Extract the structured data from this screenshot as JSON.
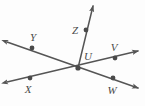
{
  "figure": {
    "background_color": "#fdfdfd",
    "stroke_color": "#555555",
    "label_color": "#4a4a4a",
    "width": 145,
    "height": 106
  },
  "chart_data": {
    "type": "diagram",
    "subtype": "geometry-line-diagram",
    "vertex": "U",
    "points": [
      {
        "label": "U",
        "role": "vertex",
        "x": 78,
        "y": 68,
        "label_x": 88,
        "label_y": 56
      },
      {
        "label": "Y",
        "role": "point-on-line",
        "x": 32,
        "y": 48,
        "label_x": 33,
        "label_y": 37
      },
      {
        "label": "X",
        "role": "point-on-line",
        "x": 30,
        "y": 78,
        "label_x": 28,
        "label_y": 89
      },
      {
        "label": "V",
        "role": "point-on-line",
        "x": 115,
        "y": 58,
        "label_x": 114,
        "label_y": 47
      },
      {
        "label": "W",
        "role": "point-on-line",
        "x": 113,
        "y": 78,
        "label_x": 112,
        "label_y": 90
      },
      {
        "label": "Z",
        "role": "point-on-ray",
        "x": 86,
        "y": 30,
        "label_x": 75,
        "label_y": 30
      }
    ],
    "lines": [
      {
        "name": "line-YW",
        "kind": "line",
        "through": [
          "Y",
          "U",
          "W"
        ],
        "x1": 7,
        "y1": 42,
        "x2": 138,
        "y2": 88,
        "arrows": "both"
      },
      {
        "name": "line-XV",
        "kind": "line",
        "through": [
          "X",
          "U",
          "V"
        ],
        "x1": 7,
        "y1": 82,
        "x2": 138,
        "y2": 51,
        "arrows": "both"
      },
      {
        "name": "ray-UZ",
        "kind": "ray",
        "through": [
          "U",
          "Z"
        ],
        "x1": 78,
        "y1": 68,
        "x2": 93,
        "y2": 5,
        "arrows": "end"
      }
    ],
    "axis_labels": [],
    "legend": []
  }
}
